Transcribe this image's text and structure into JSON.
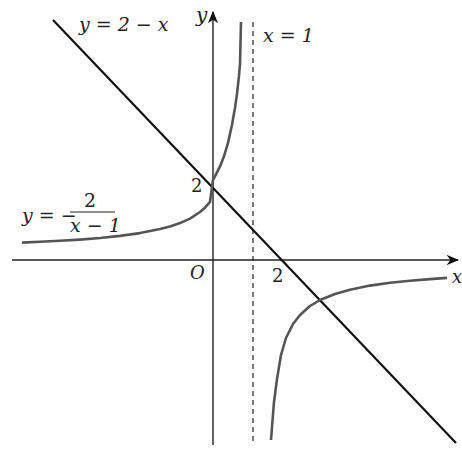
{
  "figure": {
    "type": "function-graph",
    "axes": {
      "x_label": "x",
      "y_label": "y",
      "origin_label": "O",
      "x_tick_label": "2",
      "y_tick_label": "2"
    },
    "curves": [
      {
        "name": "line",
        "label_lhs": "y = 2 − x",
        "expression": "y = 2 - x",
        "color": "#111111"
      },
      {
        "name": "hyperbola",
        "label_lhs": "y = −",
        "label_numerator": "2",
        "label_denominator": "x − 1",
        "expression": "y = -2/(x-1)",
        "color": "#555555"
      }
    ],
    "asymptote": {
      "label": "x = 1",
      "style": "dashed"
    },
    "key_points": [
      {
        "label": "2",
        "x": 0,
        "y": 2,
        "note": "intersection of line and hyperbola on y-axis"
      },
      {
        "label": "2",
        "x": 2,
        "y": 0,
        "note": "x-intercept of line"
      }
    ]
  }
}
